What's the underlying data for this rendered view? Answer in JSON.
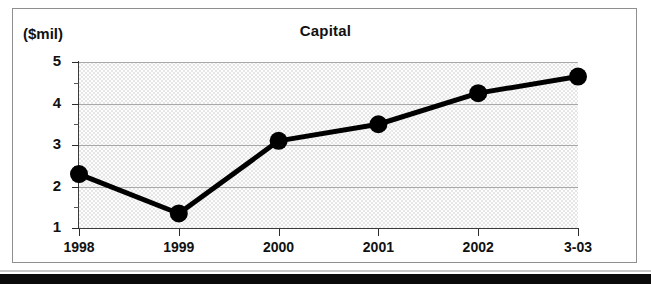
{
  "figure": {
    "unit_label": "($mil)",
    "title": "Capital"
  },
  "chart_data": {
    "type": "line",
    "title": "Capital",
    "subtitle": "",
    "xlabel": "",
    "ylabel": "($mil)",
    "categories": [
      "1998",
      "1999",
      "2000",
      "2001",
      "2002",
      "3-03"
    ],
    "values": [
      2.3,
      1.35,
      3.1,
      3.5,
      4.25,
      4.65
    ],
    "series": [
      {
        "name": "Capital",
        "values": [
          2.3,
          1.35,
          3.1,
          3.5,
          4.25,
          4.65
        ]
      }
    ],
    "ylim": [
      1,
      5
    ],
    "ytick_labels": [
      "1",
      "2",
      "3",
      "4",
      "5"
    ],
    "ytick_values": [
      1,
      2,
      3,
      4,
      5
    ],
    "yminor_tick_values": [
      1.5,
      2.5,
      3.5,
      4.5
    ],
    "xtick_labels": [
      "1998",
      "1999",
      "2000",
      "2001",
      "2002",
      "3-03"
    ],
    "grid": true,
    "legend": false,
    "legend_position": "none",
    "marker": "filled-circle",
    "line_color": "#000000",
    "marker_color": "#000000",
    "plot_background": "#e6e6e6"
  }
}
